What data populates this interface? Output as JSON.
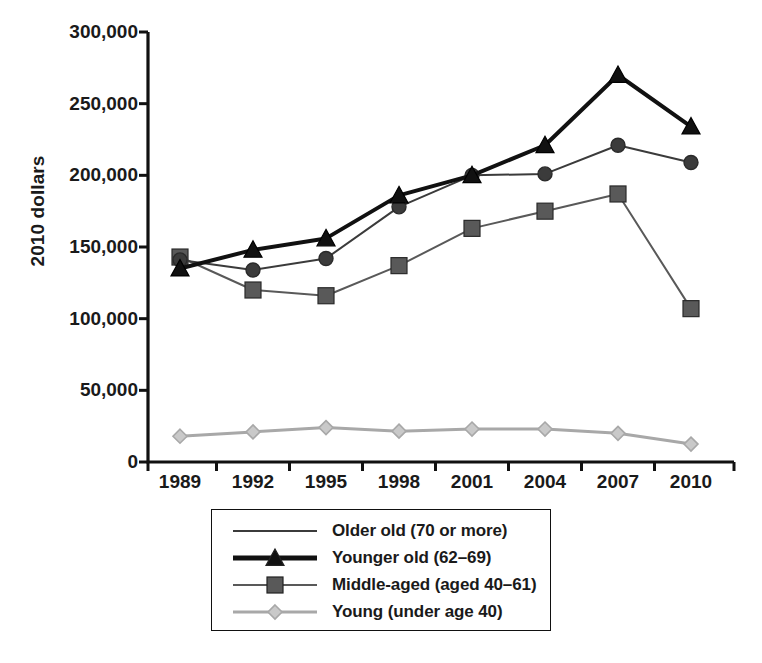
{
  "chart_data": {
    "type": "line",
    "title": "",
    "xlabel": "",
    "ylabel": "2010 dollars",
    "categories": [
      "1989",
      "1992",
      "1995",
      "1998",
      "2001",
      "2004",
      "2007",
      "2010"
    ],
    "x": [
      1989,
      1992,
      1995,
      1998,
      2001,
      2004,
      2007,
      2010
    ],
    "xlim": [
      1989,
      2010
    ],
    "ylim": [
      0,
      300000
    ],
    "yticks": [
      0,
      50000,
      100000,
      150000,
      200000,
      250000,
      300000
    ],
    "ytick_labels": [
      "0",
      "50,000",
      "100,000",
      "150,000",
      "200,000",
      "250,000",
      "300,000"
    ],
    "grid": false,
    "legend_position": "below-center",
    "series": [
      {
        "name": "Older old (70 or more)",
        "marker": "circle",
        "color": "#3b3b3b",
        "line_width": 2,
        "values": [
          141000,
          134000,
          142000,
          178000,
          200000,
          201000,
          221000,
          209000
        ]
      },
      {
        "name": "Younger old (62–69)",
        "marker": "triangle",
        "color": "#111111",
        "line_width": 4,
        "values": [
          135000,
          148000,
          156000,
          186000,
          200000,
          221000,
          270000,
          234000
        ]
      },
      {
        "name": "Middle-aged (aged 40–61)",
        "marker": "square",
        "color": "#595959",
        "line_width": 2,
        "values": [
          143000,
          120000,
          116000,
          137000,
          163000,
          175000,
          187000,
          107000
        ]
      },
      {
        "name": "Young (under age 40)",
        "marker": "diamond",
        "color": "#a8a8a8",
        "line_width": 3,
        "values": [
          18000,
          21000,
          24000,
          21500,
          23000,
          23000,
          20000,
          12500
        ]
      }
    ]
  },
  "axes": {
    "y_axis_title": "2010 dollars"
  },
  "legend": {
    "entries": [
      {
        "label": "Older old (70 or more)",
        "marker": "none",
        "color": "#3b3b3b",
        "line_width": 2
      },
      {
        "label": "Younger old (62–69)",
        "marker": "triangle",
        "color": "#111111",
        "line_width": 5
      },
      {
        "label": "Middle-aged (aged 40–61)",
        "marker": "square",
        "color": "#595959",
        "line_width": 2
      },
      {
        "label": "Young (under age 40)",
        "marker": "diamond",
        "color": "#a8a8a8",
        "line_width": 3
      }
    ]
  }
}
